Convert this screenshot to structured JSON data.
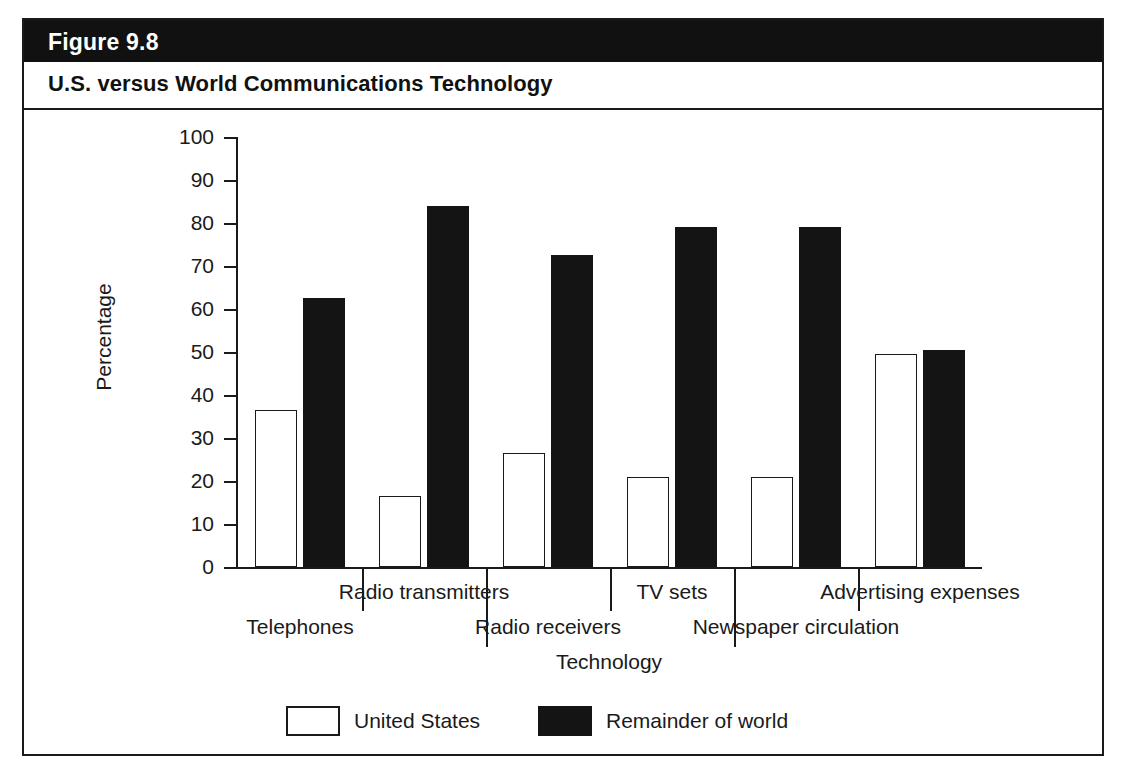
{
  "figure": {
    "number": "Figure 9.8",
    "subtitle": "U.S. versus World Communications Technology"
  },
  "legend": {
    "items": [
      {
        "label": "United States",
        "swatch": "open-white-rectangle"
      },
      {
        "label": "Remainder of world",
        "swatch": "filled-black-rectangle"
      }
    ]
  },
  "chart_data": {
    "type": "bar",
    "title": "U.S. versus World Communications Technology",
    "xlabel": "Technology",
    "ylabel": "Percentage",
    "ylim": [
      0,
      100
    ],
    "yticks": [
      0,
      10,
      20,
      30,
      40,
      50,
      60,
      70,
      80,
      90,
      100
    ],
    "grid": false,
    "legend_position": "bottom-center",
    "categories": [
      "Telephones",
      "Radio transmitters",
      "Radio receivers",
      "TV sets",
      "Newspaper circulation",
      "Advertising expenses"
    ],
    "series": [
      {
        "name": "United States",
        "color": "#ffffff",
        "values": [
          36.5,
          16.5,
          26.5,
          21,
          21,
          49.5
        ]
      },
      {
        "name": "Remainder of world",
        "color": "#141414",
        "values": [
          62.5,
          84,
          72.5,
          79,
          79,
          50.5
        ]
      }
    ]
  },
  "colors": {
    "frame": "#1a1a1a",
    "header_background": "#111111",
    "header_text": "#ffffff",
    "bar_us": "#ffffff",
    "bar_world": "#141414",
    "page_background": "#ffffff"
  }
}
